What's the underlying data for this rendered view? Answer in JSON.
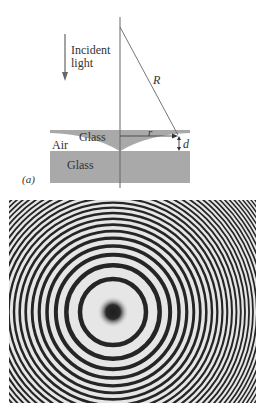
{
  "diagram": {
    "panel_label": "(a)",
    "incident_light_label_line1": "Incident",
    "incident_light_label_line2": "light",
    "radius_label": "R",
    "small_radius_label": "r",
    "gap_label": "d",
    "air_label": "Air",
    "lens_label": "Glass",
    "plate_label": "Glass",
    "colors": {
      "glass": "#a9a9a9",
      "lines": "#555555",
      "text": "#333333"
    }
  },
  "photo": {
    "description": "Newton's rings interference pattern",
    "center": [
      113,
      312
    ],
    "first_dark_ring_radius": 33,
    "colors": {
      "dark": "#1a1a1a",
      "light": "#e8e8e8"
    }
  }
}
